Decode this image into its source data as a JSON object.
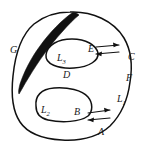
{
  "figure": {
    "type": "topological-domain-diagram",
    "background_color": "#ffffff",
    "ink_color": "#111111",
    "labels": {
      "outer_left": "G",
      "outer_right": "C",
      "region_interior": "D",
      "upper_loop": "L",
      "upper_loop_sub": "3",
      "lower_loop": "L",
      "lower_loop_sub": "2",
      "outer_boundary": "L",
      "outer_boundary_sub": "1",
      "upper_contact": "E",
      "lower_contact": "B",
      "bottom_right": "A",
      "right_arc": "F"
    },
    "arrows": {
      "upper_pair": [
        "right",
        "left"
      ],
      "lower_pair": [
        "right",
        "left"
      ]
    },
    "shaded_region": "black-crescent-cut"
  }
}
